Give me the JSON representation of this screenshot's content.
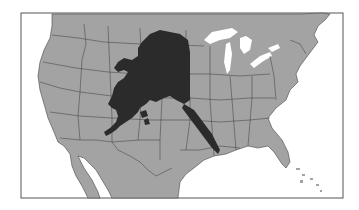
{
  "map": {
    "title": "Alaska overlaid on the contiguous United States",
    "colors": {
      "background": "#ffffff",
      "land": "#a3a3a3",
      "overlay": "#2b2b2b",
      "borders": "#3a3a3a",
      "water": "#ffffff",
      "frame": "#555555"
    },
    "layers": [
      {
        "name": "contiguous-us-and-surroundings",
        "fill": "land"
      },
      {
        "name": "state-borders",
        "stroke": "borders"
      },
      {
        "name": "great-lakes",
        "fill": "water"
      },
      {
        "name": "alaska-overlay",
        "fill": "overlay"
      }
    ]
  }
}
